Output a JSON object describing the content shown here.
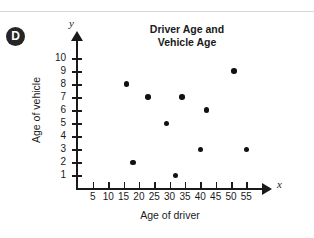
{
  "badge": {
    "letter": "D"
  },
  "chart_data": {
    "type": "scatter",
    "title": "Driver Age and Vehicle Age",
    "title_line1": "Driver Age and",
    "title_line2": "Vehicle Age",
    "xlabel": "Age of driver",
    "ylabel": "Age of vehicle",
    "x_axis_letter": "x",
    "y_axis_letter": "y",
    "xlim": [
      0,
      60
    ],
    "ylim": [
      0,
      10.5
    ],
    "grid": false,
    "legend": "none",
    "xticks": [
      5,
      10,
      15,
      20,
      25,
      30,
      35,
      40,
      45,
      50,
      55
    ],
    "yticks": [
      1,
      2,
      3,
      4,
      5,
      6,
      7,
      8,
      9,
      10
    ],
    "points": [
      {
        "x": 16,
        "y": 8
      },
      {
        "x": 18,
        "y": 2
      },
      {
        "x": 23,
        "y": 7
      },
      {
        "x": 29,
        "y": 5
      },
      {
        "x": 32,
        "y": 1
      },
      {
        "x": 34,
        "y": 7
      },
      {
        "x": 40,
        "y": 3
      },
      {
        "x": 42,
        "y": 6
      },
      {
        "x": 51,
        "y": 9
      },
      {
        "x": 55,
        "y": 3
      }
    ]
  }
}
